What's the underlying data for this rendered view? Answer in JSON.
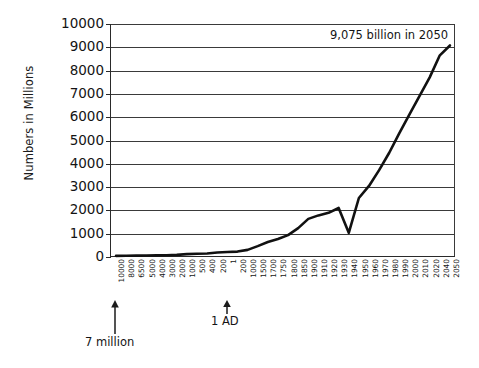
{
  "chart_data": {
    "type": "line",
    "title": "",
    "xlabel": "",
    "ylabel": "Numbers in Millions",
    "ylim": [
      0,
      10000
    ],
    "ytick_labels": [
      "10000",
      "9000",
      "8000",
      "7000",
      "6000",
      "5000",
      "4000",
      "3000",
      "2000",
      "1000",
      "0"
    ],
    "ytick_values": [
      10000,
      9000,
      8000,
      7000,
      6000,
      5000,
      4000,
      3000,
      2000,
      1000,
      0
    ],
    "grid": true,
    "legend": "none",
    "categories": [
      "10000",
      "8000",
      "6500",
      "5000",
      "4000",
      "3000",
      "2000",
      "1000",
      "500",
      "400",
      "200",
      "1",
      "200",
      "1000",
      "1500",
      "1700",
      "1750",
      "1800",
      "1850",
      "1900",
      "1910",
      "1920",
      "1930",
      "1940",
      "1950",
      "1960",
      "1970",
      "1980",
      "1990",
      "2000",
      "2010",
      "2020",
      "2040",
      "2050"
    ],
    "values": [
      7,
      10,
      15,
      20,
      25,
      35,
      50,
      80,
      100,
      110,
      150,
      170,
      190,
      265,
      425,
      600,
      730,
      900,
      1200,
      1600,
      1750,
      1860,
      2070,
      1000,
      2500,
      3020,
      3700,
      4450,
      5300,
      6100,
      6900,
      7700,
      8650,
      9075
    ],
    "annotations": [
      {
        "name": "peak-2050-label",
        "text": "9,075 billion in 2050",
        "x_category": "2050",
        "y_value": 9075
      },
      {
        "name": "start-callout",
        "text": "7 million",
        "x_category": "10000",
        "y_value": 7
      },
      {
        "name": "one-ad-callout",
        "text": "1 AD",
        "x_category": "1",
        "y_value": 170
      }
    ]
  },
  "axes": {
    "y_title": "Numbers in Millions"
  },
  "labels": {
    "annotation_2050": "9,075 billion in 2050",
    "callout_7million": "7 million",
    "callout_1ad": "1 AD"
  }
}
